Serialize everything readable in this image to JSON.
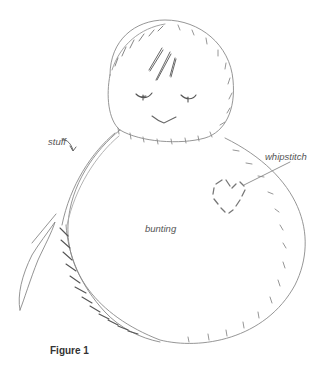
{
  "figure": {
    "caption": "Figure 1",
    "labels": {
      "stuff": "stuff",
      "whipstitch": "whipstitch",
      "bunting": "bunting"
    },
    "colors": {
      "line": "#8a8a8a",
      "dark_line": "#555555",
      "text": "#555555"
    }
  }
}
